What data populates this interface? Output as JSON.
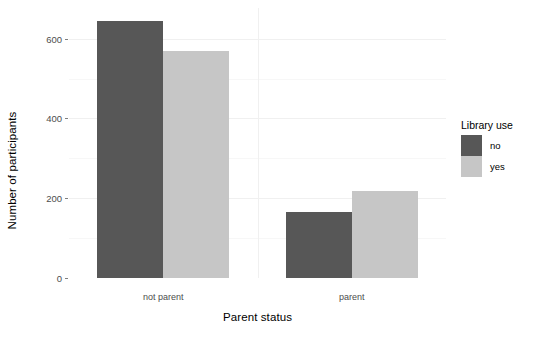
{
  "chart_data": {
    "type": "bar",
    "title": "",
    "subtitle": "",
    "xlabel": "Parent status",
    "ylabel": "Number of participants",
    "categories": [
      "not parent",
      "parent"
    ],
    "series": [
      {
        "name": "no",
        "color": "#575757",
        "values": [
          645,
          166
        ]
      },
      {
        "name": "yes",
        "color": "#c6c6c6",
        "values": [
          570,
          218
        ]
      }
    ],
    "legend": {
      "title": "Library use",
      "position": "right",
      "entries": [
        {
          "label": "no",
          "color": "#575757"
        },
        {
          "label": "yes",
          "color": "#c6c6c6"
        }
      ]
    },
    "yticks": [
      0,
      200,
      400,
      600
    ],
    "yticklabels": [
      "0",
      "200",
      "400",
      "600"
    ],
    "ylim": [
      0,
      677
    ],
    "xticklabels": [
      "not parent",
      "parent"
    ],
    "grid": {
      "major_y": true,
      "minor_y": true,
      "major_x": true,
      "color_major": "#f0f0f0",
      "color_minor": "#f7f7f7"
    },
    "background": "#ffffff",
    "bar_position": "dodge"
  }
}
